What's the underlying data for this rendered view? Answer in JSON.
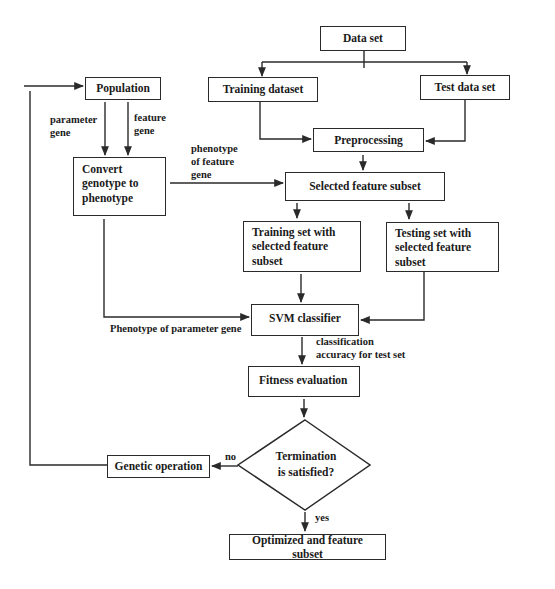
{
  "diagram": {
    "type": "flowchart",
    "nodes": {
      "data_set": "Data set",
      "training_dataset": "Training dataset",
      "test_data_set": "Test data set",
      "preprocessing": "Preprocessing",
      "selected_feature_subset": "Selected feature subset",
      "training_set_selected": "Training set with\nselected feature\nsubset",
      "testing_set_selected": "Testing set with\nselected feature\nsubset",
      "svm_classifier": "SVM classifier",
      "fitness_evaluation": "Fitness evaluation",
      "termination": "Termination\nis satisfied?",
      "genetic_operation": "Genetic operation",
      "optimized": "Optimized and feature subset",
      "population": "Population",
      "convert": "Convert\ngenotype to\nphenotype"
    },
    "edge_labels": {
      "parameter_gene": "parameter\ngene",
      "feature_gene": "feature\ngene",
      "phenotype_feature_gene": "phenotype\nof feature\ngene",
      "phenotype_parameter_gene": "Phenotype of parameter gene",
      "classification_accuracy": "classification\naccuracy for test set",
      "no": "no",
      "yes": "yes"
    },
    "colors": {
      "line": "#2a2a2a",
      "background": "#ffffff",
      "text": "#1a1a1a"
    }
  }
}
